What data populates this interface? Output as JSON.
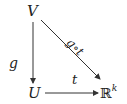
{
  "diagram": {
    "type": "commutative-diagram",
    "nodes": {
      "top": "V",
      "bottom_left": "U",
      "bottom_right_base": "ℝ",
      "bottom_right_exp": "k"
    },
    "arrows": [
      {
        "from": "V",
        "to": "U",
        "label": "g"
      },
      {
        "from": "V",
        "to": "ℝ^k",
        "label": "g∘t"
      },
      {
        "from": "U",
        "to": "ℝ^k",
        "label": "t"
      }
    ],
    "labels": {
      "left": "g",
      "diagonal": "g∘t",
      "bottom": "t"
    },
    "colors": {
      "arrow": "#333333",
      "text": "#222222"
    }
  }
}
